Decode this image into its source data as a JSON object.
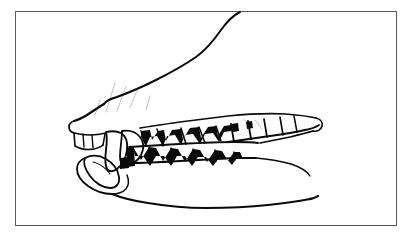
{
  "figure": {
    "domain": "Natural-Image",
    "media": "black-and-white line drawing / ink illustration",
    "orientation": "left-facing snout, muzzle tip at left, jaw hinge toward right",
    "title": "",
    "caption": "",
    "background_color": "#ffffff",
    "ink_color": "#0a0a0a",
    "frame": {
      "present": true,
      "color": "#555a5e",
      "thickness_px": 1.5,
      "left": 15,
      "top": 11,
      "width": 382,
      "height": 215
    },
    "canvas": {
      "width": 413,
      "height": 239
    }
  },
  "anatomy": {
    "regions": [
      {
        "name": "muzzle-top-profile",
        "description": "Long sloping dorsal outline of the snout rising from lower-left to upper-right, exiting at the top frame edge"
      },
      {
        "name": "nose-tip",
        "description": "Rounded rhinarium at the far left of the muzzle"
      },
      {
        "name": "upper-lip-margin",
        "description": "Gum line running right along the top of the maxillary tooth row"
      },
      {
        "name": "maxillary-tooth-row",
        "description": "Upper teeth: incisors, canine, premolars and carnassial with dark shadowed interdental gaps"
      },
      {
        "name": "mandibular-tooth-row",
        "description": "Lower teeth occluding against the upper row, with zigzag cusp silhouettes"
      },
      {
        "name": "lower-canine",
        "description": "Large recurved lower canine tooth at the front of the mandible"
      },
      {
        "name": "mandible-ventral-outline",
        "description": "Sweeping lower jaw contour curving down from the chin and back to the right"
      },
      {
        "name": "cheek-shading",
        "description": "Faint diagonal hatch strokes suggesting the cheek and muzzle wrinkle"
      }
    ],
    "tooth_groups": [
      {
        "name": "upper-incisors",
        "count": 3,
        "position": "muzzle tip, small rectangular crowns"
      },
      {
        "name": "upper-canine",
        "count": 1,
        "position": "immediately behind the incisors, large and pointed"
      },
      {
        "name": "upper-premolars",
        "count": 4,
        "position": "mid tooth row, triangular crowns"
      },
      {
        "name": "upper-carnassial-and-molars",
        "count": 3,
        "position": "posterior, broad flat-topped crowns"
      },
      {
        "name": "lower-canine",
        "count": 1,
        "position": "front of mandible, curving upward"
      },
      {
        "name": "lower-premolars-molars",
        "count": 7,
        "position": "mandibular row with sharp triangular cusps"
      }
    ]
  },
  "labels": {
    "annotations": [],
    "scale_bar": null,
    "figure_number": ""
  }
}
